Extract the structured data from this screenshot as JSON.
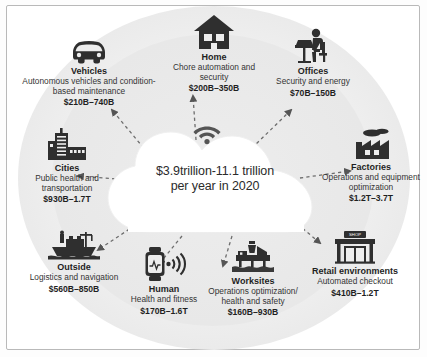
{
  "center": {
    "name": "cloud-value",
    "line1": "$3.9trillion-11.1 trillion",
    "line2": "per year in 2020",
    "icon": "wifi-icon"
  },
  "nodes": [
    {
      "id": "vehicles",
      "icon": "car-icon",
      "title": "Vehicles",
      "description": "Autonomous vehicles and condition-based maintenance",
      "value": "$210B–740B"
    },
    {
      "id": "home",
      "icon": "house-icon",
      "title": "Home",
      "description": "Chore automation and security",
      "value": "$200B–350B"
    },
    {
      "id": "offices",
      "icon": "office-worker-icon",
      "title": "Offices",
      "description": "Security and energy",
      "value": "$70B–150B"
    },
    {
      "id": "factories",
      "icon": "factory-icon",
      "title": "Factories",
      "description": "Operations and equipment optimization",
      "value": "$1.2T–3.7T"
    },
    {
      "id": "retail",
      "icon": "shop-icon",
      "title": "Retail environments",
      "description": "Automated checkout",
      "value": "$410B–1.2T"
    },
    {
      "id": "worksites",
      "icon": "oil-rig-icon",
      "title": "Worksites",
      "description": "Operations optimization/ health and safety",
      "value": "$160B–930B"
    },
    {
      "id": "human",
      "icon": "smartwatch-icon",
      "title": "Human",
      "description": "Health and fitness",
      "value": "$170B–1.6T"
    },
    {
      "id": "outside",
      "icon": "cargo-ship-icon",
      "title": "Outside",
      "description": "Logistics and navigation",
      "value": "$560B–850B"
    },
    {
      "id": "cities",
      "icon": "city-buildings-icon",
      "title": "Cities",
      "description": "Public health and transportation",
      "value": "$930B–1.7T"
    }
  ],
  "shop_sign": "SHOP",
  "colors": {
    "icon": "#2f2f2f",
    "text": "#1f1f1f",
    "cloud": "#ffffff",
    "backdrop": "#ededed"
  }
}
